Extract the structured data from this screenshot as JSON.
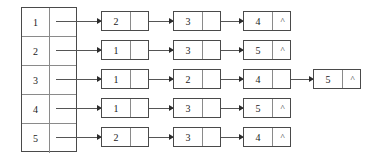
{
  "diagram": {
    "null_symbol": "^",
    "colors": {
      "border": "#4a4a4a",
      "inner_rule": "#8a8a8a",
      "arrow": "#555555",
      "text": "#1a1a1a",
      "background": "#ffffff"
    },
    "index_table": {
      "name": "vertex-index-table",
      "rows": [
        {
          "key": "1"
        },
        {
          "key": "2"
        },
        {
          "key": "3"
        },
        {
          "key": "4"
        },
        {
          "key": "5"
        }
      ]
    },
    "lists": [
      {
        "source": "1",
        "nodes": [
          {
            "value": "2",
            "next": ""
          },
          {
            "value": "3",
            "next": ""
          },
          {
            "value": "4",
            "next": "^"
          }
        ]
      },
      {
        "source": "2",
        "nodes": [
          {
            "value": "1",
            "next": ""
          },
          {
            "value": "3",
            "next": ""
          },
          {
            "value": "5",
            "next": "^"
          }
        ]
      },
      {
        "source": "3",
        "nodes": [
          {
            "value": "1",
            "next": ""
          },
          {
            "value": "2",
            "next": ""
          },
          {
            "value": "4",
            "next": ""
          },
          {
            "value": "5",
            "next": "^"
          }
        ]
      },
      {
        "source": "4",
        "nodes": [
          {
            "value": "1",
            "next": ""
          },
          {
            "value": "3",
            "next": ""
          },
          {
            "value": "5",
            "next": "^"
          }
        ]
      },
      {
        "source": "5",
        "nodes": [
          {
            "value": "2",
            "next": ""
          },
          {
            "value": "3",
            "next": ""
          },
          {
            "value": "4",
            "next": "^"
          }
        ]
      }
    ]
  }
}
